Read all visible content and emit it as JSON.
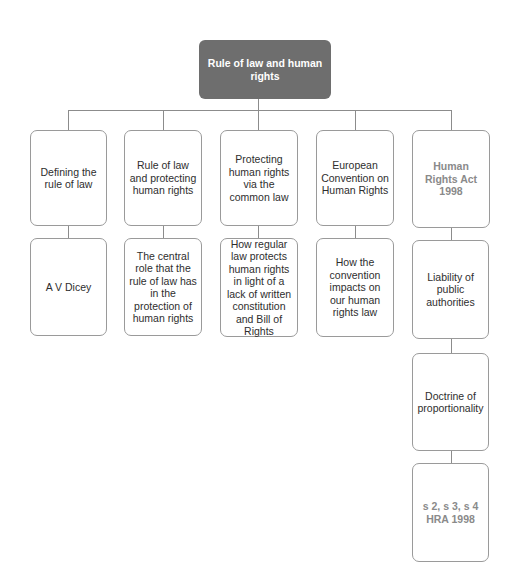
{
  "diagram": {
    "type": "hierarchy",
    "root": {
      "label": "Rule of law and human rights"
    },
    "branches": [
      {
        "label": "Defining the rule of law",
        "children": [
          "A V Dicey"
        ]
      },
      {
        "label": "Rule of law and protecting human rights",
        "children": [
          "The central role that the rule of law has in the protection of human rights"
        ]
      },
      {
        "label": "Protecting human rights via the common law",
        "children": [
          "How regular law protects human rights in light of a lack of written constitution and Bill of Rights"
        ]
      },
      {
        "label": "European Convention on Human Rights",
        "children": [
          "How the convention impacts on our human rights law"
        ]
      },
      {
        "label": "Human Rights Act 1998",
        "children": [
          "Liability of public authorities",
          "Doctrine of proportionality",
          "s 2, s 3, s 4 HRA 1998"
        ]
      }
    ]
  },
  "colors": {
    "root_fill": "#6e6e6e",
    "border": "#9a9a9a",
    "muted_text": "#8a8a8a"
  }
}
